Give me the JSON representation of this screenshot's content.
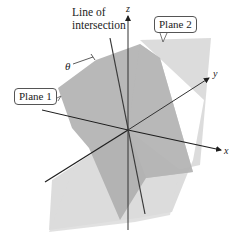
{
  "figure": {
    "labels": {
      "line_of_intersection_line1": "Line of",
      "line_of_intersection_line2": "intersection",
      "plane1": "Plane 1",
      "plane2": "Plane 2",
      "theta": "θ",
      "axis_x": "x",
      "axis_y": "y",
      "axis_z": "z"
    },
    "colors": {
      "plane1_fill": "#a9a9a9",
      "plane2_fill": "#d4d4d4",
      "axis_stroke": "#1e1e1e",
      "intersection_stroke": "#3a3a3a",
      "background": "#ffffff"
    }
  }
}
